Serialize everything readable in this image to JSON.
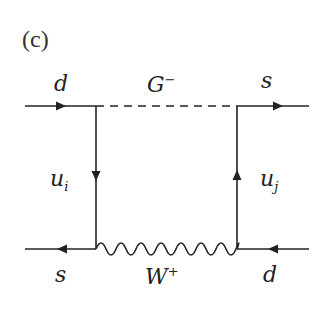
{
  "panel_label": "(c)",
  "labels": {
    "top_left": "d",
    "top_mid": "G",
    "top_mid_sup": "−",
    "top_right": "s",
    "left_mid": "u",
    "left_mid_sub": "i",
    "right_mid": "u",
    "right_mid_sub": "j",
    "bottom_left": "s",
    "bottom_mid": "W",
    "bottom_mid_sup": "+",
    "bottom_right": "d"
  },
  "colors": {
    "line": "#222222",
    "background": "#ffffff"
  }
}
